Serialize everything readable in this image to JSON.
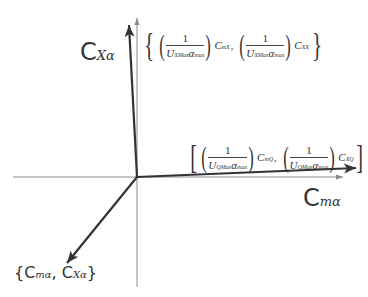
{
  "diagram": {
    "type": "vector-axes",
    "origin": {
      "x": 137,
      "y": 177
    },
    "colors": {
      "axis": "#8a8a8a",
      "vector": "#333333",
      "background": "#ffffff"
    },
    "axes": {
      "vertical": {
        "label_main": "C",
        "label_sub": "Xα"
      },
      "horizontal": {
        "label_main": "C",
        "label_sub": "mα"
      }
    },
    "vectors": {
      "upper": {
        "open": "{",
        "close": "}",
        "term1": {
          "num": "1",
          "den_U": "U",
          "den_U_sub": "XMax",
          "den_a": "α",
          "den_a_sub": "max",
          "coef": "C",
          "coef_sub": "mX"
        },
        "separator": ",",
        "term2": {
          "num": "1",
          "den_U": "U",
          "den_U_sub": "XMax",
          "den_a": "α",
          "den_a_sub": "max",
          "coef": "C",
          "coef_sub": "XX"
        }
      },
      "right": {
        "open": "[",
        "close": "]",
        "term1": {
          "num": "1",
          "den_U": "U",
          "den_U_sub": "QMax",
          "den_a": "α",
          "den_a_sub": "max",
          "coef": "C",
          "coef_sub": "mQ"
        },
        "separator": ",",
        "term2": {
          "num": "1",
          "den_U": "U",
          "den_U_sub": "QMax",
          "den_a": "α",
          "den_a_sub": "max",
          "coef": "C",
          "coef_sub": "XQ"
        }
      },
      "lower_left": {
        "open": "{",
        "c1": "C",
        "c1_sub": "mα",
        "separator": ", ",
        "c2": "C",
        "c2_sub": "Xα",
        "close": "}"
      }
    }
  }
}
